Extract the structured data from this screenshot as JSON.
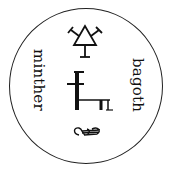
{
  "seal": {
    "left_word": "minther",
    "right_word": "bagoth",
    "symbols": [
      "triangle-sigil",
      "ladder-sigil",
      "loop-sigil"
    ],
    "ink_color": "#111111",
    "background": "#ffffff"
  }
}
